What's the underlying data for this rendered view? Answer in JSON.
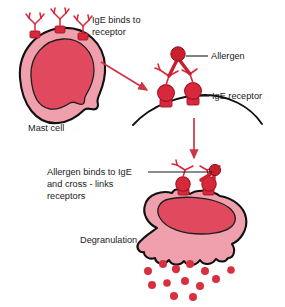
{
  "figure": {
    "background": "#ffffff"
  },
  "colors": {
    "cytoplasm": "#F0A0AC",
    "cytoplasm_light": "#F4B2BC",
    "nucleus": "#E0495E",
    "nucleus_dark": "#D23B50",
    "outline": "#111111",
    "receptor_red": "#D8293C",
    "allergen_red": "#C8202F",
    "granule_red": "#D8303F",
    "arrow_red": "#CE3346",
    "membrane_line": "#111111",
    "leader_line": "#1a1a1a",
    "text": "#1a1a1a"
  },
  "labels": {
    "ige_binds": {
      "line1": "IgE binds to",
      "line2": "receptor"
    },
    "mast_cell": "Mast cell",
    "allergen": "Allergen",
    "ige_receptor": "IgE receptor",
    "cross_links": {
      "line1": "Allergen binds to IgE",
      "line2": "and cross - links",
      "line3": "receptors"
    },
    "degranulation": "Degranulation"
  },
  "stages": [
    {
      "id": "stage-1",
      "name": "mast-cell-resting",
      "caption": "Mast cell",
      "annotation": "IgE binds to receptor",
      "receptor_count": 3
    },
    {
      "id": "stage-2",
      "name": "allergen-binding-membrane",
      "annotations": [
        "Allergen",
        "IgE receptor"
      ],
      "receptor_count": 2
    },
    {
      "id": "stage-3",
      "name": "mast-cell-degranulating",
      "caption": "Degranulation",
      "annotation": "Allergen binds to IgE and cross - links receptors",
      "receptor_count": 2,
      "granule_count": 13
    }
  ],
  "arrows": [
    {
      "name": "arrow-stage1-to-stage2",
      "direction": "down-right"
    },
    {
      "name": "arrow-stage2-to-stage3",
      "direction": "down"
    }
  ],
  "granules": [
    {
      "cx": 148,
      "cy": 271,
      "r": 4.0
    },
    {
      "cx": 163,
      "cy": 264,
      "r": 4.0
    },
    {
      "cx": 176,
      "cy": 269,
      "r": 4.2
    },
    {
      "cx": 190,
      "cy": 264,
      "r": 4.0
    },
    {
      "cx": 205,
      "cy": 271,
      "r": 4.0
    },
    {
      "cx": 152,
      "cy": 285,
      "r": 4.0
    },
    {
      "cx": 167,
      "cy": 283,
      "r": 3.8
    },
    {
      "cx": 185,
      "cy": 281,
      "r": 4.0
    },
    {
      "cx": 200,
      "cy": 286,
      "r": 4.0
    },
    {
      "cx": 216,
      "cy": 279,
      "r": 4.0
    },
    {
      "cx": 174,
      "cy": 296,
      "r": 4.0
    },
    {
      "cx": 193,
      "cy": 297,
      "r": 4.0
    },
    {
      "cx": 231,
      "cy": 270,
      "r": 3.8
    }
  ]
}
